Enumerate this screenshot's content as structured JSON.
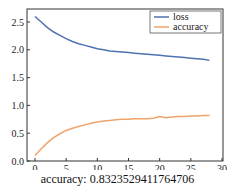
{
  "chart_data": {
    "type": "line",
    "title": "",
    "xlabel": "",
    "ylabel": "",
    "xlim": [
      -1.5,
      30
    ],
    "ylim": [
      0,
      2.7
    ],
    "xticks": [
      0,
      5,
      10,
      15,
      20,
      25,
      30
    ],
    "yticks": [
      0.0,
      0.5,
      1.0,
      1.5,
      2.0,
      2.5
    ],
    "ytick_labels": [
      "0.0",
      "0.5",
      "1.0",
      "1.5",
      "2.0",
      "2.5"
    ],
    "grid": false,
    "legend_position": "upper right",
    "x": [
      0,
      1,
      2,
      3,
      4,
      5,
      6,
      7,
      8,
      9,
      10,
      11,
      12,
      13,
      14,
      15,
      16,
      17,
      18,
      19,
      20,
      21,
      22,
      23,
      24,
      25,
      26,
      27,
      28
    ],
    "series": [
      {
        "name": "loss",
        "color": "#4c72b0",
        "values": [
          2.6,
          2.5,
          2.4,
          2.32,
          2.26,
          2.2,
          2.15,
          2.11,
          2.08,
          2.05,
          2.02,
          2.0,
          1.98,
          1.97,
          1.96,
          1.95,
          1.94,
          1.93,
          1.92,
          1.91,
          1.9,
          1.89,
          1.88,
          1.87,
          1.86,
          1.85,
          1.84,
          1.83,
          1.81
        ]
      },
      {
        "name": "accuracy",
        "color": "#f0a36b",
        "values": [
          0.1,
          0.22,
          0.33,
          0.42,
          0.49,
          0.55,
          0.59,
          0.62,
          0.65,
          0.68,
          0.7,
          0.72,
          0.73,
          0.74,
          0.75,
          0.75,
          0.76,
          0.76,
          0.76,
          0.77,
          0.8,
          0.78,
          0.79,
          0.8,
          0.8,
          0.81,
          0.81,
          0.82,
          0.82
        ]
      }
    ],
    "annotation": "accuracy: 0.8323529411764706"
  },
  "legend": {
    "loss": "loss",
    "accuracy": "accuracy"
  },
  "caption": "accuracy: 0.8323529411764706"
}
